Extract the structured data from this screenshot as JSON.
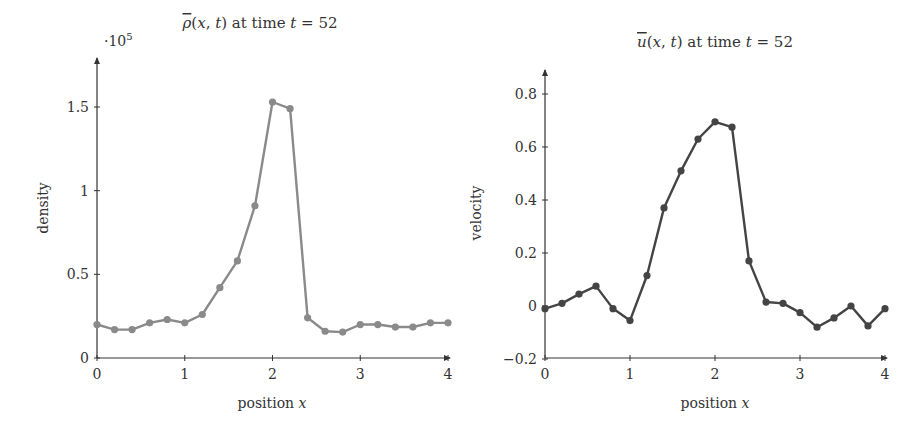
{
  "chart_data": [
    {
      "type": "line",
      "title": "ρ̄(x,t) at time t = 52",
      "title_parts": {
        "symbol": "ρ",
        "args": "(x, t)",
        "text": " at time ",
        "var": "t",
        "eq": " = 52"
      },
      "xlabel": "position x",
      "xlabel_parts": {
        "text": "position ",
        "var": "x"
      },
      "ylabel": "density",
      "y_multiplier": "·10^5",
      "y_multiplier_parts": {
        "base": "·10",
        "exp": "5"
      },
      "xlim": [
        0,
        4
      ],
      "ylim": [
        0,
        1.75
      ],
      "xticks": [
        0,
        1,
        2,
        3,
        4
      ],
      "xtick_labels": [
        "0",
        "1",
        "2",
        "3",
        "4"
      ],
      "yticks": [
        0,
        0.5,
        1,
        1.5
      ],
      "ytick_labels": [
        "0",
        "0.5",
        "1",
        "1.5"
      ],
      "grid": false,
      "line_color": "#8a8a8a",
      "series": [
        {
          "name": "density",
          "x": [
            0,
            0.2,
            0.4,
            0.6,
            0.8,
            1.0,
            1.2,
            1.4,
            1.6,
            1.8,
            2.0,
            2.2,
            2.4,
            2.6,
            2.8,
            3.0,
            3.2,
            3.4,
            3.6,
            3.8,
            4.0
          ],
          "values": [
            0.2,
            0.17,
            0.17,
            0.21,
            0.23,
            0.21,
            0.26,
            0.42,
            0.58,
            0.91,
            1.53,
            1.49,
            0.24,
            0.16,
            0.155,
            0.2,
            0.2,
            0.185,
            0.185,
            0.21,
            0.21
          ]
        }
      ]
    },
    {
      "type": "line",
      "title": "ū(x,t) at time t = 52",
      "title_parts": {
        "symbol": "u",
        "args": "(x, t)",
        "text": " at time ",
        "var": "t",
        "eq": " = 52"
      },
      "xlabel": "position x",
      "xlabel_parts": {
        "text": "position ",
        "var": "x"
      },
      "ylabel": "velocity",
      "xlim": [
        0,
        4
      ],
      "ylim": [
        -0.2,
        0.9
      ],
      "xticks": [
        0,
        1,
        2,
        3,
        4
      ],
      "xtick_labels": [
        "0",
        "1",
        "2",
        "3",
        "4"
      ],
      "yticks": [
        -0.2,
        0,
        0.2,
        0.4,
        0.6,
        0.8
      ],
      "ytick_labels": [
        "−0.2",
        "0",
        "0.2",
        "0.4",
        "0.6",
        "0.8"
      ],
      "grid": false,
      "line_color": "#444444",
      "series": [
        {
          "name": "velocity",
          "x": [
            0,
            0.2,
            0.4,
            0.6,
            0.8,
            1.0,
            1.2,
            1.4,
            1.6,
            1.8,
            2.0,
            2.2,
            2.4,
            2.6,
            2.8,
            3.0,
            3.2,
            3.4,
            3.6,
            3.8,
            4.0
          ],
          "values": [
            -0.01,
            0.01,
            0.045,
            0.075,
            -0.01,
            -0.055,
            0.115,
            0.37,
            0.51,
            0.63,
            0.695,
            0.675,
            0.17,
            0.015,
            0.01,
            -0.025,
            -0.08,
            -0.045,
            0.0,
            -0.075,
            -0.01
          ]
        }
      ]
    }
  ]
}
